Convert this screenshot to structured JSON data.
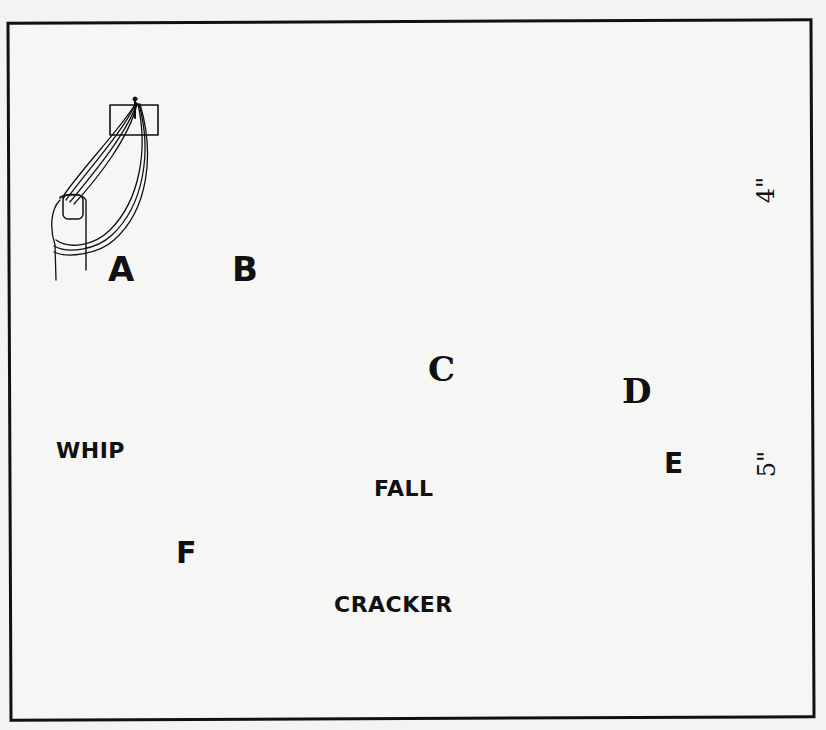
{
  "figure": {
    "steps": [
      {
        "id": "A",
        "label": "A",
        "description": "Strands looped over thumb from pinned tab"
      },
      {
        "id": "B",
        "label": "B",
        "description": "Strands divided into two halves and twisted"
      },
      {
        "id": "C",
        "label": "C",
        "description": "Hands twisting the two halves together into a cord"
      },
      {
        "id": "D",
        "label": "D",
        "description": "Twisted cord tied off with a knot"
      },
      {
        "id": "E",
        "label": "E",
        "description": "Finished cracker with twisted top and loose tassel"
      },
      {
        "id": "F",
        "label": "F",
        "description": "Cracker attached to fall, fall attached to whip"
      }
    ],
    "part_labels": {
      "whip": "WHIP",
      "fall": "FALL",
      "cracker": "CRACKER"
    },
    "dimensions": {
      "twisted_length": "4\"",
      "tassel_length": "5\""
    },
    "colors": {
      "ink": "#111111",
      "paper": "#f6f6f4"
    }
  }
}
